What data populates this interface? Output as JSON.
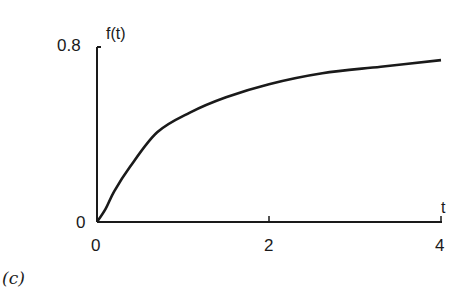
{
  "chart_data": {
    "type": "line",
    "title": "",
    "xlabel": "t",
    "ylabel": "f(t)",
    "xlim": [
      0,
      4
    ],
    "ylim": [
      0,
      0.8
    ],
    "xticks": [
      "0",
      "2",
      "4"
    ],
    "yticks": [
      "0",
      "0.8"
    ],
    "grid": false,
    "series": [
      {
        "name": "f(t)",
        "x": [
          0,
          0.1,
          0.2,
          0.38,
          0.7,
          1.08,
          1.5,
          2.0,
          2.62,
          3.3,
          4.0
        ],
        "values": [
          0,
          0.06,
          0.14,
          0.25,
          0.41,
          0.5,
          0.57,
          0.63,
          0.68,
          0.71,
          0.74
        ]
      }
    ],
    "panel_label": "(c)"
  }
}
